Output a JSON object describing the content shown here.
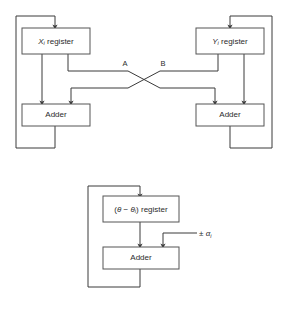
{
  "diagram": {
    "type": "block-diagram",
    "background_color": "#ffffff",
    "line_color": "#3a3a3a",
    "box_stroke_color": "#555555",
    "box_fill_color": "#ffffff",
    "text_color": "#2b2b2b",
    "sections": [
      {
        "name": "coordinate-datapath",
        "description": "X and Y registers feeding cross-coupled adders"
      },
      {
        "name": "angle-accumulator",
        "description": "Angle register and adder with plus or minus alpha input"
      }
    ]
  },
  "blocks": {
    "x_register": {
      "label_main": "X",
      "label_sub": "i",
      "label_rest": " register"
    },
    "y_register": {
      "label_main": "Y",
      "label_sub": "i",
      "label_rest": " register"
    },
    "left_adder": {
      "label": "Adder"
    },
    "right_adder": {
      "label": "Adder"
    },
    "angle_register": {
      "label_prefix": "(",
      "label_theta": "θ",
      "label_minus": " − ",
      "label_theta2": "θ",
      "label_sub": "i",
      "label_suffix": ") register"
    },
    "angle_adder": {
      "label": "Adder"
    }
  },
  "wire_labels": {
    "a": "A",
    "b": "B"
  },
  "inputs": {
    "alpha": {
      "sign": "± ",
      "symbol": "α",
      "subscript": "i"
    }
  }
}
